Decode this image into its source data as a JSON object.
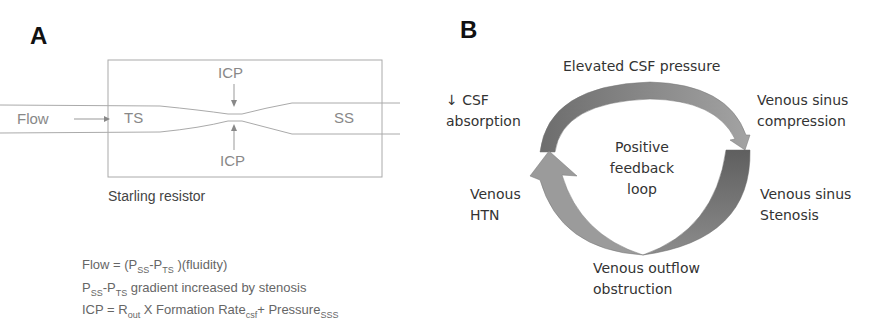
{
  "panel_a": {
    "label": "A",
    "flow_label": "Flow",
    "ts_label": "TS",
    "ss_label": "SS",
    "icp_top": "ICP",
    "icp_bottom": "ICP",
    "caption": "Starling resistor",
    "equations": {
      "line1": {
        "a": "Flow = (P",
        "sub1": "SS",
        "b": "-P",
        "sub2": "TS",
        "c": " )(fluidity)"
      },
      "line2": {
        "a": "P",
        "sub1": "SS",
        "b": "-P",
        "sub2": "TS",
        "c": " gradient increased by stenosis"
      },
      "line3": {
        "a": "ICP = R",
        "sub1": "out",
        "b": " X Formation Rate",
        "sub2": "csf",
        "c": "+ Pressure",
        "sub3": "SSS"
      }
    }
  },
  "panel_b": {
    "label": "B",
    "center_text": [
      "Positive",
      "feedback",
      "loop"
    ],
    "top": "Elevated CSF pressure",
    "top_left": [
      "↓ CSF",
      "absorption"
    ],
    "top_right": [
      "Venous sinus",
      "compression"
    ],
    "bottom_left": [
      "Venous",
      "HTN"
    ],
    "bottom_right": [
      "Venous sinus",
      "Stenosis"
    ],
    "bottom": [
      "Venous outflow",
      "obstruction"
    ]
  },
  "colors": {
    "arrow_light": "#9a9a9a",
    "arrow_dark": "#6e6e6e",
    "line": "#aaaaaa"
  }
}
